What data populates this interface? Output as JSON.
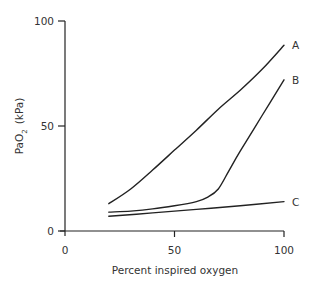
{
  "chart_data": {
    "type": "line",
    "title": "",
    "xlabel": "Percent inspired oxygen",
    "ylabel": "PaO2 (kPa)",
    "ylabel_main": "PaO",
    "ylabel_sub": "2",
    "ylabel_unit": "(kPa)",
    "xlim": [
      0,
      100
    ],
    "ylim": [
      0,
      100
    ],
    "x_ticks": [
      0,
      50,
      100
    ],
    "y_ticks": [
      0,
      50,
      100
    ],
    "x_tick_labels": [
      "0",
      "50",
      "100"
    ],
    "y_tick_labels": [
      "0",
      "50",
      "100"
    ],
    "grid": false,
    "legend": "inline labels at line ends (right)",
    "series": [
      {
        "name": "A",
        "x": [
          20,
          30,
          40,
          50,
          60,
          70,
          80,
          90,
          100
        ],
        "y": [
          13,
          20,
          29,
          38.5,
          48,
          58,
          67,
          77,
          88.5
        ]
      },
      {
        "name": "B",
        "x": [
          20,
          30,
          40,
          50,
          60,
          65,
          70,
          75,
          80,
          90,
          100
        ],
        "y": [
          9,
          9.5,
          10.5,
          12,
          14,
          16,
          20,
          29,
          38,
          55,
          72
        ]
      },
      {
        "name": "C",
        "x": [
          20,
          40,
          60,
          80,
          100
        ],
        "y": [
          7,
          8.6,
          10.3,
          12,
          14
        ]
      }
    ]
  }
}
